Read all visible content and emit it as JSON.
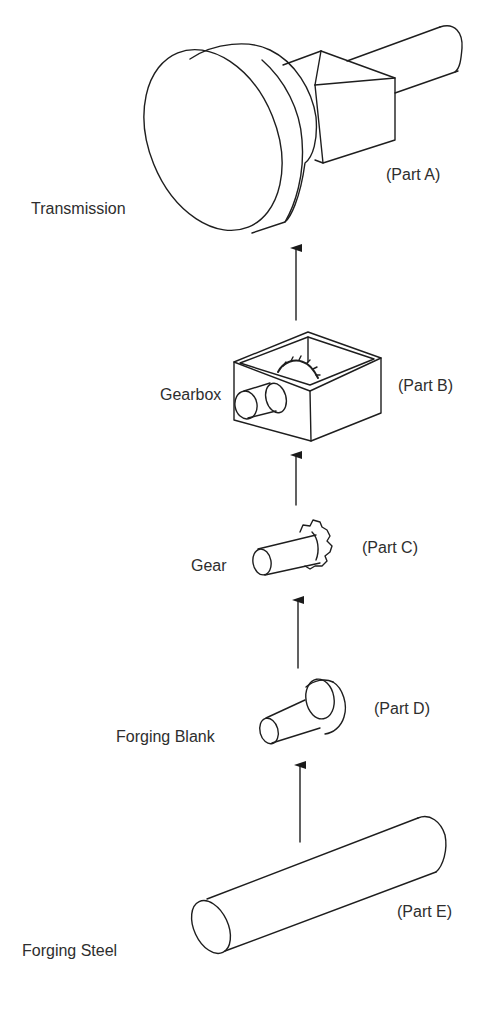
{
  "diagram": {
    "type": "bill-of-materials-flow",
    "direction": "bottom-to-top",
    "stages": [
      {
        "id": "A",
        "name": "Transmission",
        "part_label": "(Part A)"
      },
      {
        "id": "B",
        "name": "Gearbox",
        "part_label": "(Part B)"
      },
      {
        "id": "C",
        "name": "Gear",
        "part_label": "(Part C)"
      },
      {
        "id": "D",
        "name": "Forging Blank",
        "part_label": "(Part D)"
      },
      {
        "id": "E",
        "name": "Forging Steel",
        "part_label": "(Part E)"
      }
    ],
    "edges": [
      {
        "from": "E",
        "to": "D"
      },
      {
        "from": "D",
        "to": "C"
      },
      {
        "from": "C",
        "to": "B"
      },
      {
        "from": "B",
        "to": "A"
      }
    ]
  }
}
